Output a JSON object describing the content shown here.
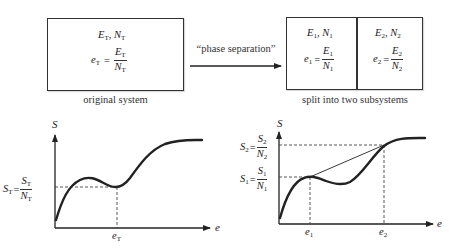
{
  "top_row": {
    "original_system": {
      "line1": {
        "E": "E",
        "E_sub": "T",
        "N": "N",
        "N_sub": "T"
      },
      "line2": {
        "lhs": "e",
        "lhs_sub": "T",
        "eq": "=",
        "num": "E",
        "num_sub": "T",
        "den": "N",
        "den_sub": "T"
      },
      "caption": "original system"
    },
    "arrow_label": "“phase separation”",
    "subsystems": {
      "left": {
        "line1": {
          "E": "E",
          "E_sub": "1",
          "N": "N",
          "N_sub": "1"
        },
        "line2": {
          "lhs": "e",
          "lhs_sub": "1",
          "eq": "=",
          "num": "E",
          "num_sub": "1",
          "den": "N",
          "den_sub": "1"
        }
      },
      "right": {
        "line1": {
          "E": "E",
          "E_sub": "2",
          "N": "N",
          "N_sub": "2"
        },
        "line2": {
          "lhs": "e",
          "lhs_sub": "2",
          "eq": "=",
          "num": "E",
          "num_sub": "2",
          "den": "N",
          "den_sub": "2"
        }
      },
      "caption": "split into two subsystems"
    }
  },
  "charts": {
    "left": {
      "y_axis_label": "S",
      "x_axis_label": "e",
      "level_label": {
        "lhs": "S",
        "lhs_sub": "T",
        "num": "S",
        "num_sub": "T",
        "den": "N",
        "den_sub": "T"
      },
      "x_tick": {
        "main": "e",
        "sub": "T"
      }
    },
    "right": {
      "y_axis_label": "S",
      "x_axis_label": "e",
      "level_labels": [
        {
          "lhs": "S",
          "lhs_sub": "2",
          "num": "S",
          "num_sub": "2",
          "den": "N",
          "den_sub": "2"
        },
        {
          "lhs": "S",
          "lhs_sub": "1",
          "num": "S",
          "num_sub": "1",
          "den": "N",
          "den_sub": "1"
        }
      ],
      "x_ticks": [
        {
          "main": "e",
          "sub": "1"
        },
        {
          "main": "e",
          "sub": "2"
        }
      ]
    }
  },
  "colors": {
    "ink": "#222222",
    "dashed": "#444444",
    "background": "#ffffff"
  }
}
